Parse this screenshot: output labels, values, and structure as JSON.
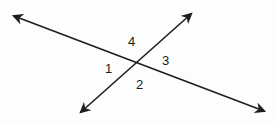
{
  "diagram": {
    "lines": [
      {
        "name": "line-a",
        "description": "line from upper-left to lower-right",
        "arrows": "both"
      },
      {
        "name": "line-b",
        "description": "line from lower-left to upper-right",
        "arrows": "both"
      }
    ],
    "angles": [
      {
        "id": "1",
        "label": "1",
        "position": "left"
      },
      {
        "id": "2",
        "label": "2",
        "position": "bottom"
      },
      {
        "id": "3",
        "label": "3",
        "position": "right"
      },
      {
        "id": "4",
        "label": "4",
        "position": "top"
      }
    ],
    "colors": {
      "stroke": "#1e1e1e",
      "text": "#1a1a1a",
      "background": "#fdfdfd"
    }
  }
}
